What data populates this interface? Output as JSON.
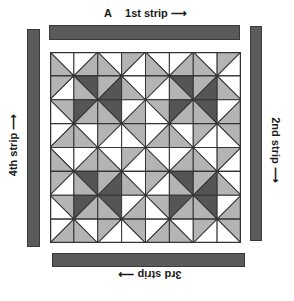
{
  "figure": {
    "letter": "A",
    "arrow": "⟶",
    "labels": {
      "first": "1st strip",
      "second": "2nd strip",
      "third": "3rd strip",
      "fourth": "4th strip"
    }
  },
  "colors": {
    "W": "#ffffff",
    "G": "#b4b4b4",
    "D": "#555555",
    "line": "#333333",
    "strip": "#5a5a5a"
  },
  "quilt": {
    "grid_size": 8,
    "cell_px": 23.75,
    "block_repeat": "4x4 block tiled 2x2",
    "block": [
      [
        {
          "d": "\\",
          "a": "W",
          "b": "G"
        },
        {
          "d": "/",
          "a": "W",
          "b": "G"
        },
        {
          "d": "\\",
          "a": "W",
          "b": "G"
        },
        {
          "d": "/",
          "a": "G",
          "b": "W"
        }
      ],
      [
        {
          "d": "/",
          "a": "G",
          "b": "W"
        },
        {
          "d": "\\",
          "a": "D",
          "b": "G"
        },
        {
          "d": "/",
          "a": "G",
          "b": "D"
        },
        {
          "d": "\\",
          "a": "W",
          "b": "G"
        }
      ],
      [
        {
          "d": "\\",
          "a": "G",
          "b": "W"
        },
        {
          "d": "/",
          "a": "D",
          "b": "G"
        },
        {
          "d": "\\",
          "a": "D",
          "b": "G"
        },
        {
          "d": "/",
          "a": "W",
          "b": "G"
        }
      ],
      [
        {
          "d": "/",
          "a": "W",
          "b": "G"
        },
        {
          "d": "\\",
          "a": "W",
          "b": "G"
        },
        {
          "d": "/",
          "a": "G",
          "b": "W"
        },
        {
          "d": "\\",
          "a": "G",
          "b": "W"
        }
      ]
    ]
  }
}
